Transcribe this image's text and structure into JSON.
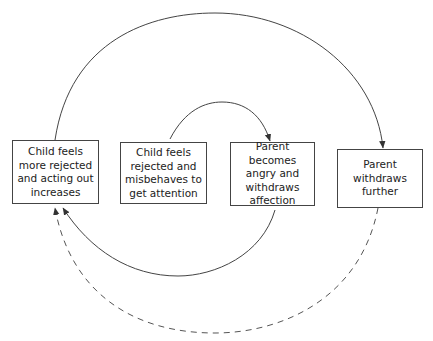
{
  "diagram": {
    "type": "cycle",
    "nodes": [
      {
        "id": "child-more-rejected",
        "label": "Child feels\nmore rejected\nand acting out\nincreases"
      },
      {
        "id": "child-rejected",
        "label": "Child feels\nrejected and\nmisbehaves to\nget attention"
      },
      {
        "id": "parent-angry",
        "label": "Parent becomes\nangry and\nwithdraws\naffection"
      },
      {
        "id": "parent-withdraws",
        "label": "Parent\nwithdraws\nfurther"
      }
    ],
    "edges": [
      {
        "from": "child-rejected",
        "to": "parent-angry",
        "style": "solid",
        "path": "top-inner"
      },
      {
        "from": "parent-angry",
        "to": "child-more-rejected",
        "style": "solid",
        "path": "bottom-inner"
      },
      {
        "from": "child-more-rejected",
        "to": "parent-withdraws",
        "style": "solid",
        "path": "top-outer"
      },
      {
        "from": "parent-withdraws",
        "to": "child-more-rejected",
        "style": "dashed",
        "path": "bottom-outer"
      }
    ],
    "colors": {
      "line": "#444444",
      "text": "#222222",
      "background": "#ffffff"
    }
  }
}
